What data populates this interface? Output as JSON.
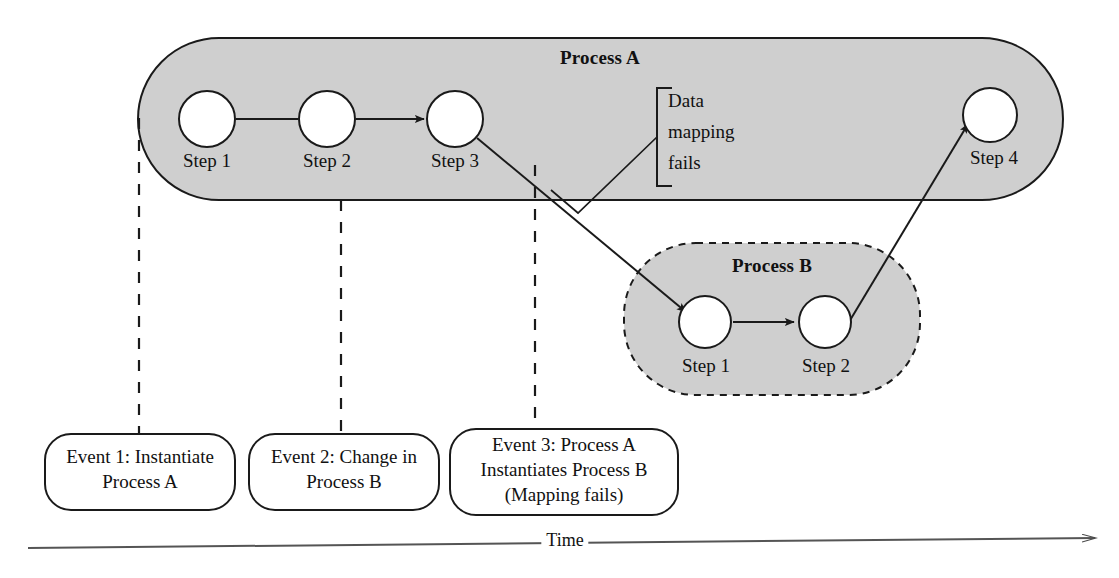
{
  "diagram": {
    "title_visible": false,
    "colors": {
      "process_fill": "#cfcfcf",
      "stroke": "#1a1a1a",
      "node_fill": "#ffffff",
      "background": "#ffffff"
    },
    "processes": [
      {
        "id": "process-a",
        "label": "Process A",
        "border_style": "solid",
        "steps": [
          {
            "label": "Step 1"
          },
          {
            "label": "Step 2"
          },
          {
            "label": "Step 3"
          },
          {
            "label": "Step 4"
          }
        ]
      },
      {
        "id": "process-b",
        "label": "Process B",
        "border_style": "dashed",
        "steps": [
          {
            "label": "Step 1"
          },
          {
            "label": "Step 2"
          }
        ]
      }
    ],
    "annotation": {
      "line1": "Data",
      "line2": "mapping",
      "line3": "fails",
      "full_text": "Data mapping fails"
    },
    "events": [
      {
        "id": "event-1",
        "line1": "Event 1: Instantiate",
        "line2": "Process A",
        "line3": ""
      },
      {
        "id": "event-2",
        "line1": "Event 2: Change in",
        "line2": "Process B",
        "line3": ""
      },
      {
        "id": "event-3",
        "line1": "Event 3: Process A",
        "line2": "Instantiates Process B",
        "line3": "(Mapping fails)"
      }
    ],
    "axis": {
      "label": "Time",
      "direction": "right"
    }
  }
}
